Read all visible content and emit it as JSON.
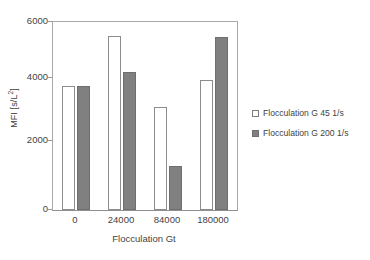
{
  "chart_data": {
    "type": "bar",
    "title": "",
    "subtitle": "",
    "xlabel": "Flocculation Gt",
    "ylabel": "MFI [s/L²]",
    "ylabel_base": "MFI [s/L",
    "ylabel_exp": "2",
    "ylabel_tail": "]",
    "categories": [
      "0",
      "24000",
      "84000",
      "180000"
    ],
    "ylim": [
      0,
      6000
    ],
    "yticks": [
      0,
      2000,
      4000,
      6000
    ],
    "ytick_labels": [
      "0",
      "2000",
      "4000",
      "6000"
    ],
    "grid": false,
    "legend_position": "right",
    "series": [
      {
        "name": "Flocculation G 45 1/s",
        "color": "#ffffff",
        "edge_color": "#8c8c8c",
        "values": [
          3970,
          5560,
          3300,
          4150
        ]
      },
      {
        "name": "Flocculation G 200 1/s",
        "color": "#808080",
        "edge_color": "#6f6f6f",
        "values": [
          3970,
          4400,
          1400,
          5520
        ]
      }
    ]
  },
  "legend": {
    "items": [
      {
        "label": "Flocculation G 45 1/s",
        "swatch": "white-square-icon"
      },
      {
        "label": "Flocculation G 200 1/s",
        "swatch": "grey-square-icon"
      }
    ]
  },
  "axes": {
    "y_title": "MFI [s/L²]",
    "x_title": "Flocculation Gt",
    "y_tick_0": "0",
    "y_tick_1": "2000",
    "y_tick_2": "4000",
    "y_tick_3": "6000",
    "x_tick_0": "0",
    "x_tick_1": "24000",
    "x_tick_2": "84000",
    "x_tick_3": "180000"
  },
  "colors": {
    "series_1": "#ffffff",
    "series_2": "#808080",
    "axis": "#a8a8a8",
    "text": "#3f3f3f",
    "background": "#ffffff"
  }
}
